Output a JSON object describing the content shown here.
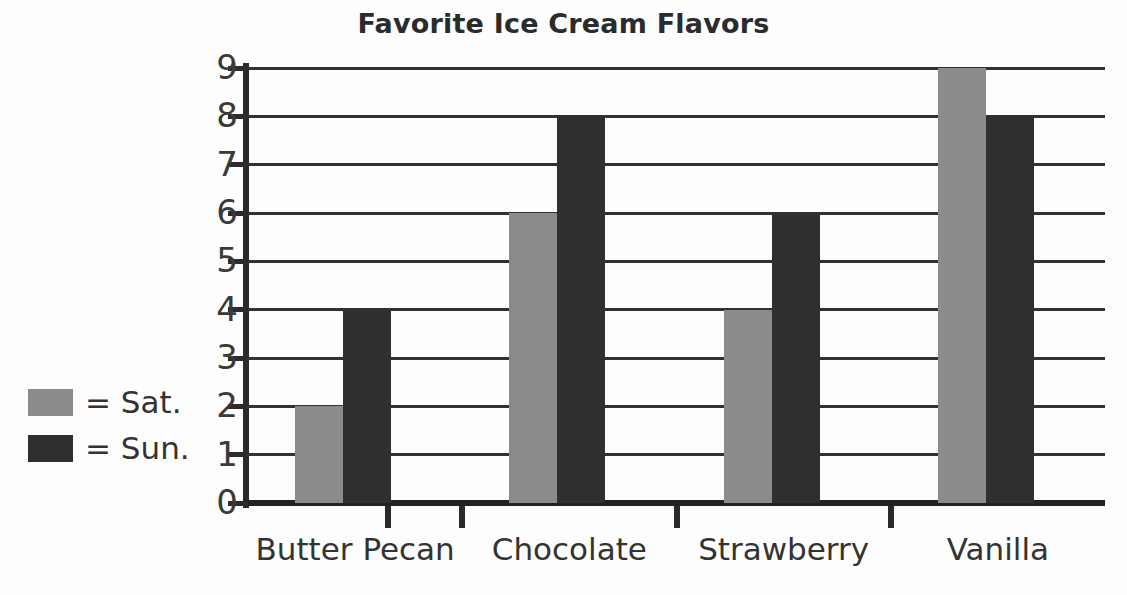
{
  "chart_data": {
    "type": "bar",
    "title": "Favorite Ice Cream Flavors",
    "xlabel": "",
    "ylabel": "",
    "categories": [
      "Butter Pecan",
      "Chocolate",
      "Strawberry",
      "Vanilla"
    ],
    "series": [
      {
        "name": "Sat.",
        "legend_label": "= Sat.",
        "color": "#8b8b8b",
        "values": [
          2,
          6,
          4,
          9
        ]
      },
      {
        "name": "Sun.",
        "legend_label": "= Sun.",
        "color": "#2f2f2e",
        "values": [
          4,
          8,
          6,
          8
        ]
      }
    ],
    "ylim": [
      0,
      9
    ],
    "yticks": [
      0,
      1,
      2,
      3,
      4,
      5,
      6,
      7,
      8,
      9
    ],
    "ytick_labels": [
      "0",
      "1",
      "2",
      "3",
      "4",
      "5",
      "6",
      "7",
      "8",
      "9"
    ],
    "grid": true,
    "grid_axis": "y",
    "legend_position": "left-outside",
    "background": "#ffffff",
    "axis_color": "#2b2a28"
  }
}
